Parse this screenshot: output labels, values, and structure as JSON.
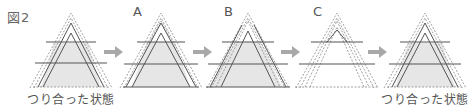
{
  "figure": {
    "label": "図2",
    "steps": [
      {
        "id": "start",
        "label": "",
        "caption": "つり合った状態",
        "center_x": 71
      },
      {
        "id": "A",
        "label": "A",
        "caption": "",
        "center_x": 161
      },
      {
        "id": "B",
        "label": "B",
        "caption": "",
        "center_x": 248
      },
      {
        "id": "C",
        "label": "C",
        "caption": "",
        "center_x": 337
      },
      {
        "id": "end",
        "label": "",
        "caption": "つり合った状態",
        "center_x": 425
      }
    ],
    "arrows": [
      {
        "from": "start",
        "to": "A"
      },
      {
        "from": "A",
        "to": "B"
      },
      {
        "from": "B",
        "to": "C"
      },
      {
        "from": "C",
        "to": "end"
      }
    ]
  },
  "colors": {
    "line": "#555555",
    "dotted": "#8a8a8a",
    "fill": "#e6e6e6",
    "arrow": "#a8a8a8",
    "text": "#555555"
  }
}
